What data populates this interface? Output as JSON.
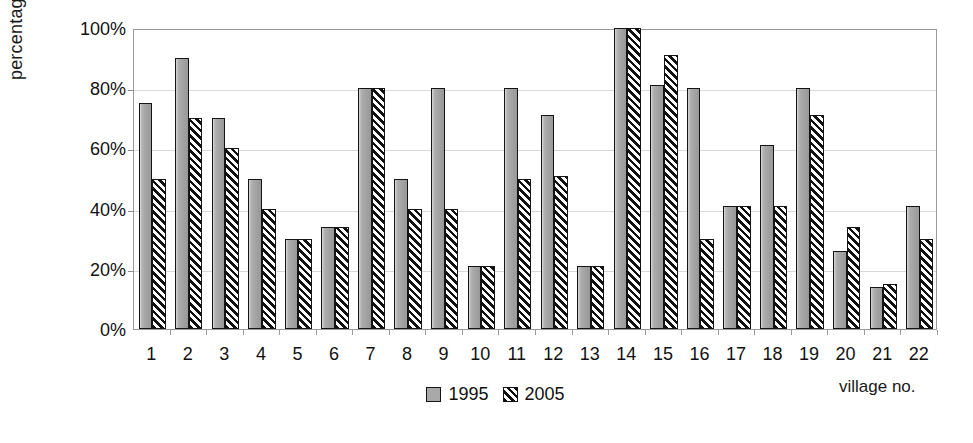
{
  "chart_data": {
    "type": "bar",
    "title": "",
    "xlabel": "village no.",
    "ylabel": "percentage",
    "ylim": [
      0,
      100
    ],
    "yticks": [
      "0%",
      "20%",
      "40%",
      "60%",
      "80%",
      "100%"
    ],
    "ytick_values": [
      0,
      20,
      40,
      60,
      80,
      100
    ],
    "grid": true,
    "legend_position": "bottom-center",
    "categories": [
      "1",
      "2",
      "3",
      "4",
      "5",
      "6",
      "7",
      "8",
      "9",
      "10",
      "11",
      "12",
      "13",
      "14",
      "15",
      "16",
      "17",
      "18",
      "19",
      "20",
      "21",
      "22"
    ],
    "series": [
      {
        "name": "1995",
        "fill": "solid-gray",
        "color": "#a9a9a9",
        "values": [
          75,
          90,
          70,
          50,
          30,
          34,
          80,
          50,
          80,
          21,
          80,
          71,
          21,
          100,
          81,
          80,
          41,
          61,
          80,
          26,
          14,
          41
        ]
      },
      {
        "name": "2005",
        "fill": "diagonal-hatch",
        "color": "#111111",
        "values": [
          50,
          70,
          60,
          40,
          30,
          34,
          80,
          40,
          40,
          21,
          50,
          51,
          21,
          100,
          91,
          30,
          41,
          41,
          71,
          34,
          15,
          30
        ]
      }
    ]
  },
  "colors": {
    "series_1995": "#a9a9a9",
    "series_2005": "#111111",
    "frame": "#9a9a9a",
    "gridline": "#d9d9d9",
    "text": "#111111",
    "background": "#ffffff"
  }
}
